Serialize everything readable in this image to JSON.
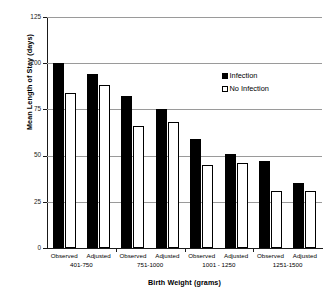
{
  "chart_data": {
    "type": "bar",
    "title": "",
    "xlabel": "Birth Weight (grams)",
    "ylabel": "Mean Length of Stay (days)",
    "ylim": [
      0,
      125
    ],
    "yticks": [
      0,
      25,
      50,
      75,
      100,
      125
    ],
    "ytick_labels": [
      "0",
      "25",
      "50",
      "75",
      "100",
      "125"
    ],
    "grid": "horizontal",
    "legend_position": "upper right",
    "categories": [
      "Observed 401-750",
      "Adjusted 401-750",
      "Observed 751-1000",
      "Adjusted 751-1000",
      "Observed 1001 - 1250",
      "Adjusted 1001 - 1250",
      "Observed 1251-1500",
      "Adjusted 1251-1500"
    ],
    "series": [
      {
        "name": "Infection",
        "color": "#000000",
        "values": [
          100,
          94,
          82,
          75,
          59,
          51,
          47,
          35
        ]
      },
      {
        "name": "No Infection",
        "color": "#ffffff",
        "values": [
          84,
          88,
          66,
          68,
          45,
          46,
          31,
          31
        ]
      }
    ],
    "groups": [
      {
        "weight_label": "401-750",
        "subgroups": [
          {
            "label": "Observed",
            "infection": 100,
            "no_infection": 84
          },
          {
            "label": "Adjusted",
            "infection": 94,
            "no_infection": 88
          }
        ]
      },
      {
        "weight_label": "751-1000",
        "subgroups": [
          {
            "label": "Observed",
            "infection": 82,
            "no_infection": 66
          },
          {
            "label": "Adjusted",
            "infection": 75,
            "no_infection": 68
          }
        ]
      },
      {
        "weight_label": "1001 - 1250",
        "subgroups": [
          {
            "label": "Observed",
            "infection": 59,
            "no_infection": 45
          },
          {
            "label": "Adjusted",
            "infection": 51,
            "no_infection": 46
          }
        ]
      },
      {
        "weight_label": "1251-1500",
        "subgroups": [
          {
            "label": "Observed",
            "infection": 47,
            "no_infection": 31
          },
          {
            "label": "Adjusted",
            "infection": 35,
            "no_infection": 31
          }
        ]
      }
    ]
  },
  "legend": {
    "items": [
      {
        "label": "Infection",
        "swatch": "filled"
      },
      {
        "label": "No Infection",
        "swatch": "hollow"
      }
    ]
  },
  "colors": {
    "axis": "#1a1a1a",
    "grid": "#9a9a9a",
    "infection": "#000000",
    "no_infection": "#ffffff",
    "background": "#ffffff"
  }
}
